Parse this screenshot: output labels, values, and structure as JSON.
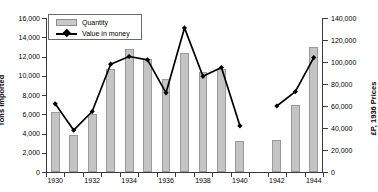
{
  "chart_data": {
    "type": "bar",
    "title": "",
    "subtitle": "",
    "xlabel": "",
    "ylabel": "Tons Imported",
    "y2label": "£P, 1936 Prices",
    "grid": false,
    "legend_position": "top-left",
    "ylim": [
      0,
      16000
    ],
    "y2lim": [
      0,
      140000
    ],
    "yticks": [
      "0",
      "2,000",
      "4,000",
      "6,000",
      "8,000",
      "10,000",
      "12,000",
      "14,000",
      "16,000"
    ],
    "ytick_values": [
      0,
      2000,
      4000,
      6000,
      8000,
      10000,
      12000,
      14000,
      16000
    ],
    "y2ticks": [
      "0",
      "20,000",
      "40,000",
      "60,000",
      "80,000",
      "100,000",
      "120,000",
      "140,000"
    ],
    "y2tick_values": [
      0,
      20000,
      40000,
      60000,
      80000,
      100000,
      120000,
      140000
    ],
    "categories": [
      "1930",
      "1931",
      "1932",
      "1933",
      "1934",
      "1935",
      "1936",
      "1937",
      "1938",
      "1939",
      "1940",
      "1941",
      "1942",
      "1943",
      "1944"
    ],
    "xtick_labels": [
      "1930",
      "1932",
      "1934",
      "1936",
      "1938",
      "1940",
      "1942",
      "1944"
    ],
    "xtick_years": [
      1930,
      1932,
      1934,
      1936,
      1938,
      1940,
      1942,
      1944
    ],
    "missing_years": [
      "1941"
    ],
    "series": [
      {
        "name": "Quantity",
        "axis": "left",
        "render": "bar",
        "color": "#c4c4c4",
        "values": [
          6200,
          3800,
          6000,
          10700,
          12800,
          11700,
          9700,
          12400,
          10400,
          10700,
          3200,
          null,
          3300,
          7000,
          13000
        ]
      },
      {
        "name": "Value in money",
        "axis": "right",
        "render": "line",
        "color": "#000000",
        "marker": "diamond",
        "values": [
          62000,
          38000,
          55000,
          98000,
          105000,
          102000,
          72000,
          131000,
          87000,
          95000,
          42000,
          null,
          60000,
          73000,
          104000
        ]
      }
    ]
  },
  "legend": {
    "items": [
      {
        "label": "Quantity",
        "marker": "bar-swatch"
      },
      {
        "label": "Value in money",
        "marker": "line-diamond"
      }
    ]
  }
}
